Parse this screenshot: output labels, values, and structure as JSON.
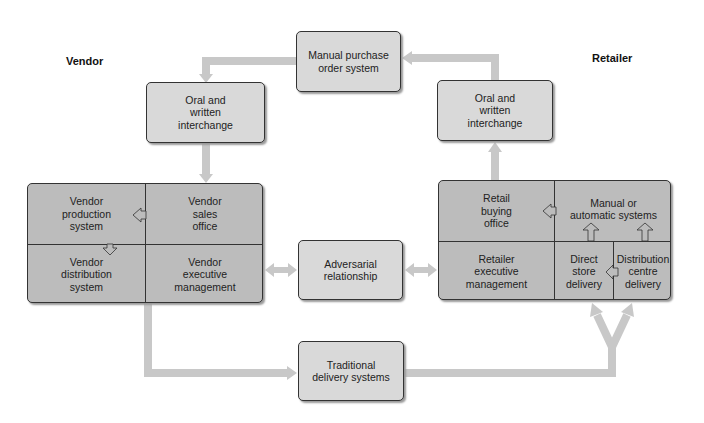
{
  "labels": {
    "vendor": "Vendor",
    "retailer": "Retailer"
  },
  "nodes": {
    "manual_po": "Manual purchase\norder system",
    "oral_left": "Oral and\nwritten\ninterchange",
    "oral_right": "Oral and\nwritten\ninterchange",
    "adversarial": "Adversarial\nrelationship",
    "traditional": "Traditional\ndelivery systems"
  },
  "vendor_block": {
    "production": "Vendor\nproduction\nsystem",
    "sales": "Vendor\nsales\noffice",
    "distribution": "Vendor\ndistribution\nsystem",
    "executive": "Vendor\nexecutive\nmanagement"
  },
  "retailer_block": {
    "buying": "Retail\nbuying\noffice",
    "systems": "Manual or\nautomatic systems",
    "executive": "Retailer\nexecutive\nmanagement",
    "direct": "Direct\nstore\ndelivery",
    "distribution": "Distribution\ncentre\ndelivery"
  },
  "colors": {
    "light_box": "#d9d9d9",
    "dark_box": "#bcbcbc",
    "arrow": "#c8c8c8",
    "border": "#333333"
  }
}
